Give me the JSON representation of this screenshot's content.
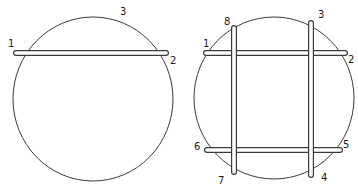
{
  "figures": [
    {
      "name": "single-rod-figure",
      "circle": {
        "cx": 93,
        "cy": 99,
        "rx": 80,
        "ry": 82
      },
      "rods": [
        {
          "x1": 16,
          "y1": 53,
          "x2": 166,
          "y2": 53
        }
      ],
      "labels": [
        {
          "text": "1",
          "x": 8,
          "y": 47
        },
        {
          "text": "2",
          "x": 170,
          "y": 64
        },
        {
          "text": "3",
          "x": 120,
          "y": 15
        }
      ]
    },
    {
      "name": "four-rod-figure",
      "circle": {
        "cx": 274,
        "cy": 98,
        "rx": 80,
        "ry": 81
      },
      "rods": [
        {
          "x1": 206,
          "y1": 53,
          "x2": 345,
          "y2": 53
        },
        {
          "x1": 207,
          "y1": 150,
          "x2": 340,
          "y2": 150
        },
        {
          "x1": 234,
          "y1": 28,
          "x2": 234,
          "y2": 172
        },
        {
          "x1": 311,
          "y1": 23,
          "x2": 311,
          "y2": 175
        }
      ],
      "labels": [
        {
          "text": "1",
          "x": 203,
          "y": 47
        },
        {
          "text": "2",
          "x": 348,
          "y": 63
        },
        {
          "text": "3",
          "x": 318,
          "y": 18
        },
        {
          "text": "4",
          "x": 321,
          "y": 181
        },
        {
          "text": "5",
          "x": 343,
          "y": 148
        },
        {
          "text": "6",
          "x": 194,
          "y": 150
        },
        {
          "text": "7",
          "x": 218,
          "y": 184
        },
        {
          "text": "8",
          "x": 224,
          "y": 25
        }
      ]
    }
  ],
  "colors": {
    "line": "#3a3a3a",
    "rod_fill": "#ffffff"
  }
}
